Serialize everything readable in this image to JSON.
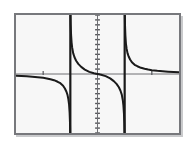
{
  "figure": {
    "title": "",
    "background_color": "#f7f7f7",
    "frame_color": "#77787c",
    "curve_color": "#1a1a1a",
    "axis_color": "#6e6f73",
    "tick_color": "#55565a",
    "shadow_color": "#c9cacc"
  },
  "chart_data": {
    "type": "line",
    "title": "",
    "subtitle": "",
    "xlabel": "",
    "ylabel": "",
    "grid": false,
    "legend": null,
    "legend_position": "none",
    "xlim": [
      -4.5,
      4.5
    ],
    "ylim": [
      -6,
      6
    ],
    "x_axis": {
      "position_y": 0,
      "tick_values": [
        -3,
        3
      ],
      "tick_labels": [
        "",
        ""
      ],
      "tick_count": 2
    },
    "y_axis": {
      "position_x": 0,
      "tick_step": 0.5,
      "tick_count": 24,
      "tick_labels": []
    },
    "asymptotes": {
      "vertical": [
        -1.5,
        1.5
      ],
      "horizontal": [
        0
      ]
    },
    "annotations": [
      "Three branches of a rational/tangent-like curve separated by two vertical asymptotes",
      "Left branch approaches y = 0 from below and falls to negative infinity at x = -1.5",
      "Middle branch falls from positive infinity at x = -1.5 through the origin to negative infinity at x = 1.5",
      "Right branch falls from positive infinity at x = 1.5 and approaches y = 0 from above"
    ],
    "series": [
      {
        "name": "left-branch",
        "x": [
          -4.5,
          -4.2,
          -3.9,
          -3.6,
          -3.3,
          -3.0,
          -2.8,
          -2.6,
          -2.4,
          -2.2,
          -2.05,
          -1.9,
          -1.8,
          -1.72,
          -1.66,
          -1.61,
          -1.57,
          -1.54,
          -1.52,
          -1.51
        ],
        "y": [
          -0.18,
          -0.2,
          -0.23,
          -0.27,
          -0.32,
          -0.39,
          -0.45,
          -0.53,
          -0.63,
          -0.79,
          -0.94,
          -1.2,
          -1.48,
          -1.78,
          -2.1,
          -2.55,
          -3.1,
          -3.9,
          -4.9,
          -6.0
        ]
      },
      {
        "name": "middle-branch",
        "x": [
          -1.49,
          -1.48,
          -1.46,
          -1.43,
          -1.4,
          -1.34,
          -1.27,
          -1.18,
          -1.05,
          -0.9,
          -0.7,
          -0.45,
          -0.2,
          0,
          0.2,
          0.45,
          0.7,
          0.9,
          1.05,
          1.18,
          1.27,
          1.34,
          1.4,
          1.43,
          1.46,
          1.48,
          1.49
        ],
        "y": [
          6.0,
          5.0,
          4.0,
          3.2,
          2.7,
          2.1,
          1.7,
          1.35,
          1.0,
          0.72,
          0.45,
          0.22,
          0.07,
          0,
          -0.07,
          -0.22,
          -0.45,
          -0.72,
          -1.0,
          -1.35,
          -1.7,
          -2.1,
          -2.7,
          -3.2,
          -4.0,
          -5.0,
          -6.0
        ]
      },
      {
        "name": "right-branch",
        "x": [
          1.51,
          1.52,
          1.54,
          1.57,
          1.61,
          1.66,
          1.72,
          1.8,
          1.9,
          2.05,
          2.2,
          2.4,
          2.6,
          2.8,
          3.0,
          3.3,
          3.6,
          3.9,
          4.2,
          4.5
        ],
        "y": [
          6.0,
          4.9,
          3.9,
          3.1,
          2.55,
          2.1,
          1.78,
          1.48,
          1.2,
          0.94,
          0.79,
          0.63,
          0.53,
          0.45,
          0.39,
          0.32,
          0.27,
          0.23,
          0.2,
          0.18
        ]
      }
    ]
  }
}
